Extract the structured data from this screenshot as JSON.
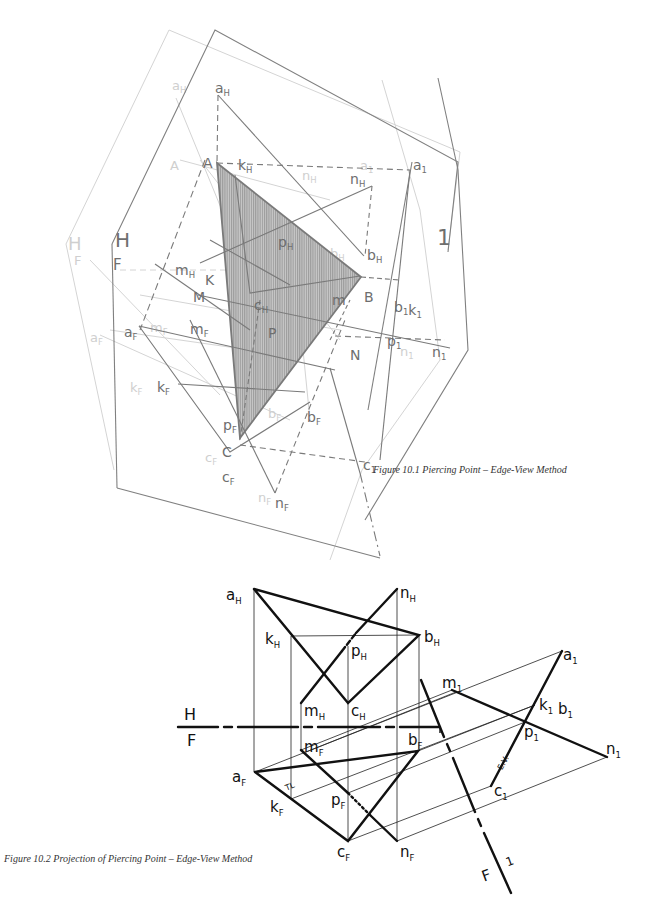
{
  "figure_1": {
    "caption": "Figure 10.1  Piercing Point – Edge-View Method",
    "plane_labels": {
      "horizontal": "H",
      "frontal": "F",
      "auxiliary": "1"
    },
    "points": {
      "A": "A",
      "B": "B",
      "C": "C",
      "K": "K",
      "M": "M",
      "N": "N",
      "P": "P",
      "a_H": [
        "a",
        "H"
      ],
      "k_H": [
        "k",
        "H"
      ],
      "n_H": [
        "n",
        "H"
      ],
      "b_H": [
        "b",
        "H"
      ],
      "p_H": [
        "p",
        "H"
      ],
      "m_H": [
        "m",
        "H"
      ],
      "c_H": [
        "c",
        "H"
      ],
      "a_1": [
        "a",
        "1"
      ],
      "b_1_k_1": [
        "b",
        "1",
        "k",
        "1"
      ],
      "p_1": [
        "p",
        "1"
      ],
      "n_1": [
        "n",
        "1"
      ],
      "c_1": [
        "c",
        "1"
      ],
      "a_F": [
        "a",
        "F"
      ],
      "m_F": [
        "m",
        "F"
      ],
      "k_F": [
        "k",
        "F"
      ],
      "b_F": [
        "b",
        "F"
      ],
      "p_F": [
        "p",
        "F"
      ],
      "c_F": [
        "c",
        "F"
      ],
      "n_F": [
        "n",
        "F"
      ],
      "m_1": [
        "m",
        "1"
      ]
    }
  },
  "figure_2": {
    "caption": "Figure 10.2  Projection of Piercing Point – Edge-View Method",
    "fold_lines": {
      "upper": "H",
      "lower": "F",
      "aux_left": "F",
      "aux_right": "1"
    },
    "annotations": {
      "true_length": "TL",
      "edge_view": "E.V."
    },
    "points": {
      "a_H": [
        "a",
        "H"
      ],
      "n_H": [
        "n",
        "H"
      ],
      "k_H": [
        "k",
        "H"
      ],
      "b_H": [
        "b",
        "H"
      ],
      "p_H": [
        "p",
        "H"
      ],
      "m_H": [
        "m",
        "H"
      ],
      "c_H": [
        "c",
        "H"
      ],
      "m_F": [
        "m",
        "F"
      ],
      "b_F": [
        "b",
        "F"
      ],
      "a_F": [
        "a",
        "F"
      ],
      "k_F": [
        "k",
        "F"
      ],
      "p_F": [
        "p",
        "F"
      ],
      "c_F": [
        "c",
        "F"
      ],
      "n_F": [
        "n",
        "F"
      ],
      "m_1": [
        "m",
        "1"
      ],
      "a_1": [
        "a",
        "1"
      ],
      "k_1_b_1": [
        "k",
        "1",
        "b",
        "1"
      ],
      "p_1": [
        "p",
        "1"
      ],
      "n_1": [
        "n",
        "1"
      ],
      "c_1": [
        "c",
        "1"
      ]
    }
  },
  "colors": {
    "ink": "#111111",
    "figure1_line": "#7a7a7a",
    "figure1_ghost": "#d2d2d2",
    "shade": "#9a9a9a"
  }
}
